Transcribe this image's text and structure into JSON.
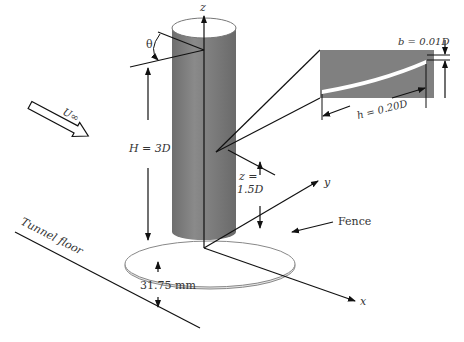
{
  "labels": {
    "axis_z": "z",
    "axis_y": "y",
    "axis_x": "x",
    "theta": "θ",
    "freestream": "U∞",
    "height": "H = 3D",
    "probe_height_line1": "z =",
    "probe_height_line2": "1.5D",
    "fence": "Fence",
    "tunnel_floor": "Tunnel floor",
    "gap": "31.75 mm",
    "inset_b": "b = 0.01D",
    "inset_h": "h = 0.20D"
  },
  "colors": {
    "cylinder_body": "#7a7a7a",
    "cylinder_top": "#ffffff",
    "inset_bg": "#808080",
    "strip": "#ffffff",
    "line": "#111111",
    "text": "#333333"
  }
}
